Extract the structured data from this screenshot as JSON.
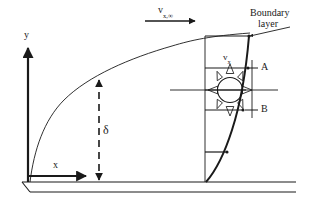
{
  "figure": {
    "type": "boundary-layer-velocity-profile-diagram",
    "background_color": "#ffffff",
    "line_color": "#1a1a1a",
    "width": 312,
    "height": 214
  },
  "axes": {
    "y_label": "y",
    "x_label": "x",
    "origin_x": 28,
    "origin_y": 182,
    "y_axis_top": 45,
    "x_axis_right": 88
  },
  "labels": {
    "free_stream_velocity": {
      "base": "v",
      "subscript": "x,",
      "superscript": "∞",
      "full": "v_x,∞"
    },
    "boundary_layer_line1": "Boundary",
    "boundary_layer_line2": "layer",
    "boundary_layer_full": "Boundary layer",
    "delta": "δ",
    "delta_meaning": "boundary layer thickness",
    "local_velocity": {
      "base": "v",
      "subscript": "x",
      "full": "v_x"
    },
    "point_a": "A",
    "point_b": "B"
  },
  "elements": {
    "free_stream_arrow": {
      "x_start": 145,
      "x_end": 196,
      "y": 21,
      "direction": "right"
    },
    "boundary_layer_leader": {
      "x_start": 248,
      "x_end": 290,
      "y_start": 36,
      "y_end": 27
    },
    "delta_arrow": {
      "x": 99,
      "y_top": 78,
      "y_bottom": 182,
      "style": "dashed",
      "heads": "both"
    },
    "profile_station_x": 205,
    "profile_arrows": [
      {
        "y": 36,
        "x_end": 250
      },
      {
        "y": 68,
        "x_end": 249
      },
      {
        "y": 90,
        "x_end": 247
      },
      {
        "y": 110,
        "x_end": 244
      },
      {
        "y": 152,
        "x_end": 228
      }
    ],
    "fluid_element": {
      "center_x": 230,
      "center_y": 90,
      "radius": 13,
      "arrow_count": 8,
      "description": "circular fluid element with eight radial momentum arrows"
    },
    "plate": {
      "top_y": 182,
      "front_y": 192,
      "left_x": 22,
      "right_x": 295
    }
  }
}
